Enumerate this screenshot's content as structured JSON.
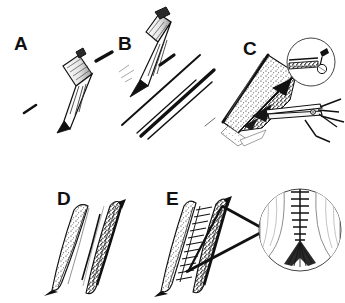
{
  "figure": {
    "type": "surgical-technique-illustration",
    "style": "black-and-white pen-and-ink line drawing",
    "width": 345,
    "height": 303,
    "background_color": "#ffffff",
    "ink_color": "#111111",
    "panel_count": 5,
    "inset_count": 2
  },
  "panels": [
    {
      "id": "A",
      "label": "A",
      "label_x": 14,
      "label_y": 34,
      "row": 1,
      "column": 1,
      "content": "scalpel with blade held at an angle above the skin, short incision marks beside it",
      "instruments": [
        "scalpel-handle",
        "scalpel-blade"
      ],
      "has_inset": false
    },
    {
      "id": "B",
      "label": "B",
      "label_x": 118,
      "label_y": 34,
      "row": 1,
      "column": 2,
      "content": "scalpel drawing a long straight incision, two parallel incision lines below the blade",
      "instruments": [
        "scalpel-handle",
        "scalpel-blade"
      ],
      "has_inset": false
    },
    {
      "id": "C",
      "label": "C",
      "label_x": 243,
      "label_y": 39,
      "row": 1,
      "column": 3,
      "content": "stippled tissue flap elevated, scissors undermining beneath the flap",
      "instruments": [
        "scissors"
      ],
      "has_inset": true,
      "inset": {
        "name": "inset-c",
        "shape": "circle",
        "center_x": 311,
        "center_y": 62,
        "radius": 24,
        "content": "magnified detail of the wound edge with instrument tip"
      }
    },
    {
      "id": "D",
      "label": "D",
      "label_x": 57,
      "label_y": 189,
      "row": 2,
      "column": 1,
      "content": "open elliptical wound with two stippled tissue edges separated",
      "instruments": [],
      "has_inset": false
    },
    {
      "id": "E",
      "label": "E",
      "label_x": 166,
      "label_y": 189,
      "row": 2,
      "column": 2,
      "content": "wound closed with a running ladder-like suture line, leader lines point to magnified inset",
      "instruments": [
        "suture"
      ],
      "has_inset": true,
      "inset": {
        "name": "inset-e",
        "shape": "circle",
        "center_x": 300,
        "center_y": 230,
        "radius": 41,
        "content": "magnified running suture line with transverse stitches and dark fan-shaped tissue base",
        "leader_lines": 2
      }
    }
  ]
}
